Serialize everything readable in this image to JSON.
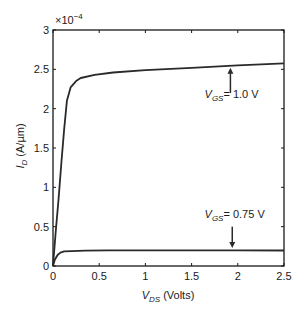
{
  "chart_data": {
    "type": "line",
    "title": "",
    "xlabel": "V_DS (Volts)",
    "ylabel": "I_D (A/µm)",
    "xlabel_parts": {
      "main": "V",
      "sub": "DS",
      "rest": " (Volts)"
    },
    "ylabel_parts": {
      "main": "I",
      "sub": "D",
      "rest": " (A/µm)"
    },
    "y_multiplier": "×10",
    "y_multiplier_exp": "−4",
    "xlim": [
      0,
      2.5
    ],
    "ylim": [
      0,
      3
    ],
    "xticks": [
      0,
      0.5,
      1,
      1.5,
      2,
      2.5
    ],
    "xtick_labels": [
      "0",
      "0.5",
      "1",
      "1.5",
      "2",
      "2.5"
    ],
    "yticks": [
      0,
      0.5,
      1,
      1.5,
      2,
      2.5,
      3
    ],
    "ytick_labels": [
      "0",
      "0.5",
      "1",
      "1.5",
      "2",
      "2.5",
      "3"
    ],
    "grid": false,
    "legend": null,
    "series": [
      {
        "name": "V_GS = 1.0 V",
        "x": [
          0,
          0.03,
          0.06,
          0.09,
          0.12,
          0.15,
          0.19,
          0.25,
          0.3,
          0.45,
          0.65,
          1.0,
          1.5,
          2.0,
          2.5
        ],
        "y": [
          0,
          0.45,
          0.84,
          1.3,
          1.73,
          2.1,
          2.27,
          2.35,
          2.39,
          2.43,
          2.46,
          2.49,
          2.52,
          2.55,
          2.575
        ]
      },
      {
        "name": "V_GS = 0.75 V",
        "x": [
          0,
          0.02,
          0.05,
          0.08,
          0.12,
          0.2,
          0.35,
          0.6,
          1.0,
          1.5,
          2.0,
          2.5
        ],
        "y": [
          0,
          0.08,
          0.14,
          0.17,
          0.185,
          0.19,
          0.195,
          0.198,
          0.2,
          0.2,
          0.198,
          0.197
        ]
      }
    ],
    "annotations": [
      {
        "label_main": "V",
        "label_sub": "GS",
        "label_rest": "= 1.0 V",
        "arrow_x": 1.92,
        "arrow_from_y": 2.2,
        "arrow_to_y": 2.52,
        "text_x": 1.64,
        "text_y": 2.13
      },
      {
        "label_main": "V",
        "label_sub": "GS",
        "label_rest": "= 0.75 V",
        "arrow_x": 1.94,
        "arrow_from_y": 0.5,
        "arrow_to_y": 0.23,
        "text_x": 1.64,
        "text_y": 0.61
      }
    ]
  },
  "style": {
    "line_color": "#2a2a2a",
    "axis_color": "#1a1a1a",
    "background": "#ffffff"
  }
}
